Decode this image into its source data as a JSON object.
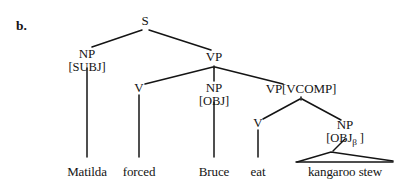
{
  "figure": {
    "item_label": "b.",
    "type": "syntax-tree",
    "sentence": "Matilda forced Bruce eat kangaroo stew",
    "line_color": "#141414",
    "text_color": "#141414",
    "background_color": "#ffffff"
  },
  "nodes": {
    "s": {
      "category": "S",
      "features": "",
      "x": 145,
      "y": 22
    },
    "np_subj": {
      "category": "NP",
      "features": "[SUBJ]",
      "x": 87,
      "y": 55
    },
    "vp": {
      "category": "VP",
      "features": "",
      "x": 214,
      "y": 58
    },
    "v1": {
      "category": "V",
      "features": "",
      "x": 139,
      "y": 89
    },
    "np_obj": {
      "category": "NP",
      "features": "[OBJ]",
      "x": 214,
      "y": 89
    },
    "vp_vcomp": {
      "category": "VP[VCOMP]",
      "features": "",
      "x": 301,
      "y": 90
    },
    "v2": {
      "category": "V",
      "features": "",
      "x": 258,
      "y": 124
    },
    "np_objb": {
      "category": "NP",
      "features_pre": "[OBJ",
      "features_sub": "β",
      "features_post": " ]",
      "x": 345,
      "y": 126
    }
  },
  "terminals": [
    {
      "text": "Matilda",
      "x": 87,
      "y": 165
    },
    {
      "text": "forced",
      "x": 139,
      "y": 165
    },
    {
      "text": "Bruce",
      "x": 214,
      "y": 165
    },
    {
      "text": "eat",
      "x": 258,
      "y": 165
    },
    {
      "text": "kangaroo stew",
      "x": 345,
      "y": 165
    }
  ],
  "triangle": {
    "label": "kangaroo stew",
    "apex_x": 331,
    "apex_y": 152,
    "left_x": 297,
    "right_x": 393,
    "base_y": 162
  }
}
